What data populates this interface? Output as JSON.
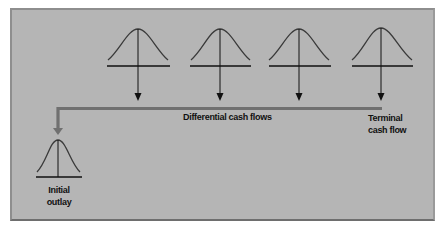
{
  "diagram": {
    "title": "",
    "colors": {
      "background": "#b5b5b5",
      "line": "#111111",
      "connector": "#707070"
    },
    "labels": {
      "differential": "Differential cash flows",
      "terminal_line1": "Terminal",
      "terminal_line2": "cash flow",
      "initial_line1": "Initial",
      "initial_line2": "outlay"
    },
    "nodes": [
      {
        "id": "differential-1",
        "type": "bell-curve",
        "center_x": 138
      },
      {
        "id": "differential-2",
        "type": "bell-curve",
        "center_x": 220
      },
      {
        "id": "differential-3",
        "type": "bell-curve",
        "center_x": 299
      },
      {
        "id": "terminal",
        "type": "bell-curve",
        "center_x": 381
      },
      {
        "id": "initial-outlay",
        "type": "bell-curve",
        "center_x": 58
      }
    ],
    "edges": [
      {
        "from": "differential-1",
        "to": "connector-bar",
        "direction": "down"
      },
      {
        "from": "differential-2",
        "to": "connector-bar",
        "direction": "down"
      },
      {
        "from": "differential-3",
        "to": "connector-bar",
        "direction": "down"
      },
      {
        "from": "terminal",
        "to": "connector-bar",
        "direction": "down"
      },
      {
        "from": "connector-bar",
        "to": "initial-outlay",
        "direction": "left-then-down"
      }
    ]
  }
}
